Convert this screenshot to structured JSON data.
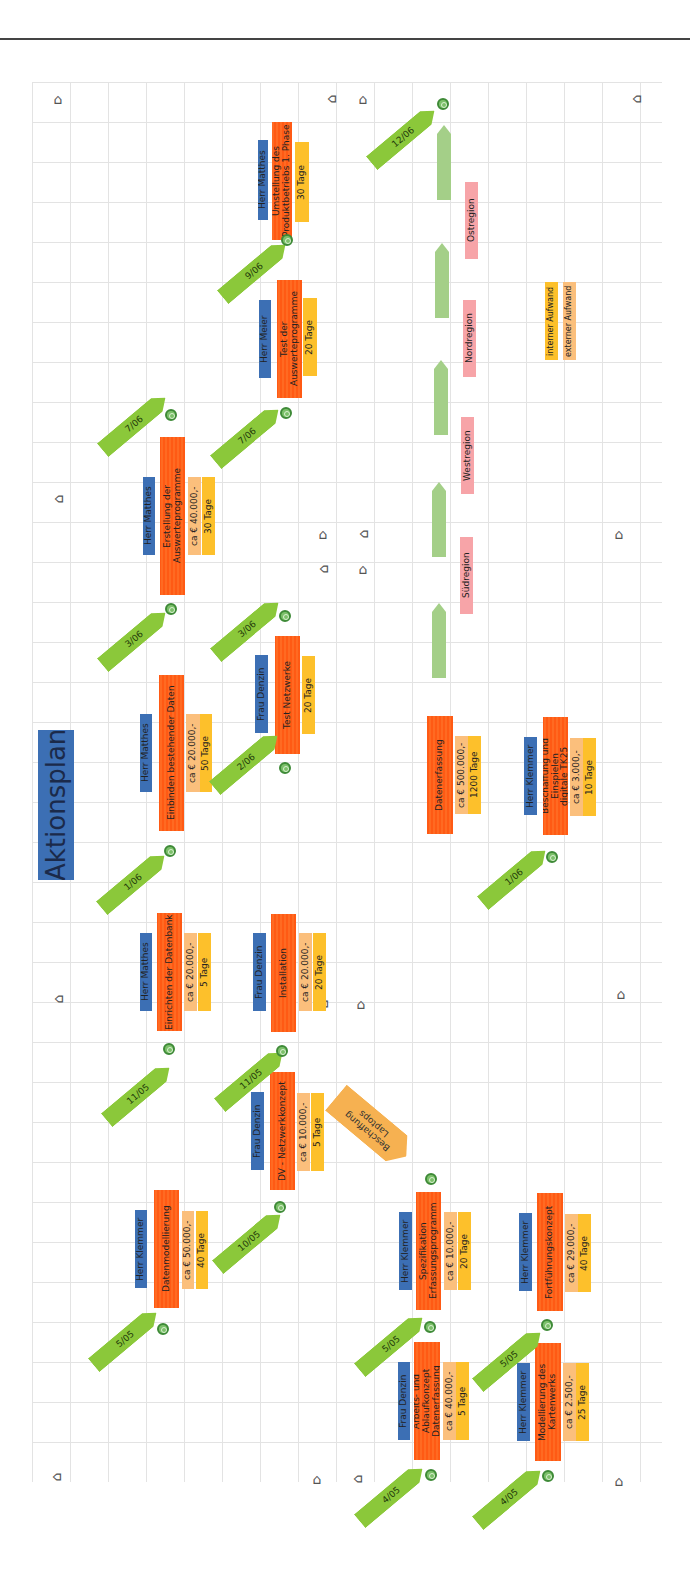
{
  "title": "Aktionsplan",
  "colors": {
    "person": "#3c6fb4",
    "task": "#ff5a14",
    "external_cost": "#fbbf7c",
    "internal_cost": "#fdc02b",
    "region": "#f7a4a8",
    "date_arrow": "#8bc83a",
    "milestone": "#7cc06a",
    "region_arrow": "#a4cf88",
    "procurement": "#f6b151"
  },
  "tasks": [
    {
      "person": "Herr Matthes",
      "task": "Umstellung des\nProduktbetriebs     1. Phase",
      "cost": "",
      "duration": "30 Tage",
      "start": "9/06",
      "end": "12/06"
    },
    {
      "person": "Herr Meier",
      "task": "Test der\nAuswerteprogramme",
      "cost": "",
      "duration": "20 Tage",
      "start": "7/06",
      "end": "9/06"
    },
    {
      "person": "Herr Matthes",
      "task": "Erstellung der Auswerteprogramme",
      "cost": "ca € 40.000,-",
      "duration": "30 Tage",
      "start": "3/06",
      "end": "7/06"
    },
    {
      "person": "Herr Matthes",
      "task": "Einbinden bestehender Daten",
      "cost": "ca € 20.000,-",
      "duration": "50 Tage",
      "start": "1/06",
      "end": "3/06"
    },
    {
      "person": "Frau Denzin",
      "task": "Test Netzwerke",
      "cost": "",
      "duration": "20 Tage",
      "start": "2/06",
      "end": "3/06"
    },
    {
      "person": "Herr Matthes",
      "task": "Einrichten der Datenbank",
      "cost": "ca € 20.000,-",
      "duration": "5 Tage",
      "start": "11/05",
      "end": "1/06"
    },
    {
      "person": "Frau Denzin",
      "task": "Installation",
      "cost": "ca € 20.000,-",
      "duration": "20 Tage",
      "start": "11/05",
      "end": "2/06"
    },
    {
      "person": "Frau Denzin",
      "task": "DV - Netzwerkkonzept",
      "cost": "ca € 10.000,-",
      "duration": "5 Tage",
      "start": "10/05",
      "end": "11/05"
    },
    {
      "person": "Herr Klemmer",
      "task": "Datenmodellierung",
      "cost": "ca € 50.000,-",
      "duration": "40 Tage",
      "start": "5/05",
      "end": "10/05"
    },
    {
      "person": "Herr Klemmer",
      "task": "Spezifikation\nErfassungsprogramm",
      "cost": "ca € 10.000,-",
      "duration": "20 Tage",
      "start": "5/05",
      "end": ""
    },
    {
      "person": "Frau Denzin",
      "task": "Arbeits- und Ablaufkonzept\nDatenerfassung",
      "cost": "ca € 40.000,-",
      "duration": "5 Tage",
      "start": "4/05",
      "end": "5/05"
    },
    {
      "person": "Herr Klemmer",
      "task": "Fortführungskonzept",
      "cost": "ca € 29.000,-",
      "duration": "40 Tage",
      "start": "5/05",
      "end": ""
    },
    {
      "person": "Herr Klemmer",
      "task": "Modellierung des\nKartenwerks",
      "cost": "ca € 2.500,-",
      "duration": "25 Tage",
      "start": "4/05",
      "end": "5/05"
    },
    {
      "person": "",
      "task": "Datenerfassung",
      "cost": "ca € 500.000,-",
      "duration": "1200 Tage",
      "start": "",
      "end": ""
    },
    {
      "person": "Herr Klemmer",
      "task": "Beschaffung und Einspielen\ndigitale TK25",
      "cost": "ca € 3.000,-",
      "duration": "10 Tage",
      "start": "",
      "end": "1/06"
    }
  ],
  "procurement_note": "Beschaffung\nLaptops",
  "regions": [
    "Südregion",
    "Westregion",
    "Nordregion",
    "Ostregion"
  ],
  "legend": {
    "internal": "interner Aufwand",
    "external": "externer Aufwand"
  },
  "dates": [
    "12/06",
    "9/06",
    "7/06",
    "7/06",
    "3/06",
    "3/06",
    "1/06",
    "2/06",
    "11/05",
    "11/05",
    "10/05",
    "5/05",
    "5/05",
    "5/05",
    "4/05",
    "4/05",
    "1/06"
  ]
}
